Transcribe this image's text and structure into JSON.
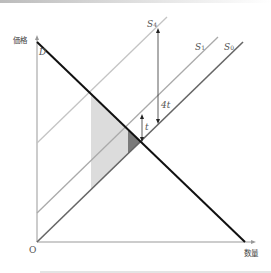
{
  "diagram": {
    "type": "supply-demand-tax",
    "axes": {
      "y_label": "価格",
      "x_label": "数量",
      "origin_label": "O"
    },
    "curves": {
      "demand": {
        "label": "D"
      },
      "s0": {
        "label": "S",
        "sub": "0"
      },
      "s1": {
        "label": "S",
        "sub": "1"
      },
      "s4": {
        "label": "S",
        "sub": "4"
      }
    },
    "markers": {
      "small_tax": "t",
      "large_tax": "4t"
    },
    "colors": {
      "demand": "#111111",
      "s0": "#666666",
      "s1": "#aaaaaa",
      "s4": "#c4c4c4",
      "light_area": "#dcdcdc",
      "dark_area": "#7a7a7a",
      "axis": "#999999"
    }
  }
}
